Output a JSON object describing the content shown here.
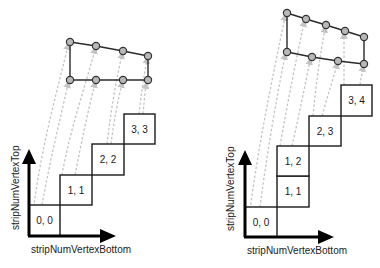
{
  "colors": {
    "background": "#ffffff",
    "cell_stroke": "#1a1a1a",
    "vertex_fill": "#b8b8b8",
    "dashed_arrow": "#c4c4c4",
    "axis": "#000000"
  },
  "panels": [
    {
      "id": "left",
      "x_axis_label": "stripNumVertexBottom",
      "y_axis_label": "stripNumVertexTop",
      "cells": [
        {
          "label": "0, 0"
        },
        {
          "label": "1, 1"
        },
        {
          "label": "2, 2"
        },
        {
          "label": "3, 3"
        }
      ],
      "top_vertex_count": 4,
      "bottom_vertex_count": 4
    },
    {
      "id": "right",
      "x_axis_label": "stripNumVertexBottom",
      "y_axis_label": "stripNumVertexTop",
      "cells": [
        {
          "label": "0, 0"
        },
        {
          "label": "1, 1"
        },
        {
          "label": "1, 2"
        },
        {
          "label": "2, 3"
        },
        {
          "label": "3, 4"
        }
      ],
      "top_vertex_count": 5,
      "bottom_vertex_count": 4
    }
  ]
}
